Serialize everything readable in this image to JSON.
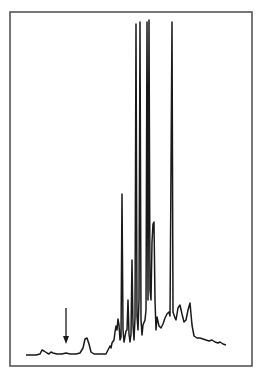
{
  "chart_data": {
    "type": "line",
    "title": "",
    "xlabel": "",
    "ylabel": "",
    "grid": false,
    "legend": null,
    "annotations": [
      {
        "type": "arrow",
        "direction": "down",
        "x_px": 66,
        "y_top_px": 308,
        "y_tip_px": 344
      }
    ],
    "frame_px": {
      "left": 10,
      "top": 12,
      "right": 252,
      "bottom": 366
    },
    "baseline_y_px": 355,
    "trace_px": [
      [
        26,
        355
      ],
      [
        36,
        355
      ],
      [
        40,
        354
      ],
      [
        42,
        350
      ],
      [
        44,
        351
      ],
      [
        47,
        353
      ],
      [
        49,
        354
      ],
      [
        51,
        352
      ],
      [
        53,
        353
      ],
      [
        57,
        354
      ],
      [
        62,
        354
      ],
      [
        66,
        353
      ],
      [
        70,
        354
      ],
      [
        76,
        354
      ],
      [
        80,
        353
      ],
      [
        83,
        348
      ],
      [
        85,
        339
      ],
      [
        87,
        338
      ],
      [
        89,
        344
      ],
      [
        91,
        352
      ],
      [
        94,
        354
      ],
      [
        106,
        354
      ],
      [
        108,
        350
      ],
      [
        110,
        346
      ],
      [
        111,
        348
      ],
      [
        112,
        343
      ],
      [
        114,
        340
      ],
      [
        115,
        332
      ],
      [
        116,
        326
      ],
      [
        117,
        330
      ],
      [
        118,
        319
      ],
      [
        119,
        325
      ],
      [
        120,
        340
      ],
      [
        121,
        337
      ],
      [
        122,
        194
      ],
      [
        123,
        330
      ],
      [
        124,
        342
      ],
      [
        126,
        331
      ],
      [
        127,
        330
      ],
      [
        128,
        300
      ],
      [
        129,
        334
      ],
      [
        130,
        342
      ],
      [
        131,
        334
      ],
      [
        132,
        260
      ],
      [
        133,
        326
      ],
      [
        134,
        340
      ],
      [
        135,
        318
      ],
      [
        136,
        24
      ],
      [
        137,
        316
      ],
      [
        138,
        330
      ],
      [
        139,
        300
      ],
      [
        140,
        22
      ],
      [
        141,
        320
      ],
      [
        142,
        335
      ],
      [
        143,
        325
      ],
      [
        145,
        320
      ],
      [
        146,
        310
      ],
      [
        147,
        22
      ],
      [
        148,
        300
      ],
      [
        149,
        20
      ],
      [
        150,
        290
      ],
      [
        151,
        300
      ],
      [
        152,
        242
      ],
      [
        153,
        224
      ],
      [
        154,
        222
      ],
      [
        155,
        300
      ],
      [
        156,
        330
      ],
      [
        157,
        317
      ],
      [
        159,
        326
      ],
      [
        161,
        328
      ],
      [
        163,
        324
      ],
      [
        165,
        318
      ],
      [
        167,
        314
      ],
      [
        169,
        312
      ],
      [
        170,
        316
      ],
      [
        172,
        22
      ],
      [
        173,
        312
      ],
      [
        175,
        318
      ],
      [
        176,
        320
      ],
      [
        178,
        308
      ],
      [
        180,
        305
      ],
      [
        182,
        314
      ],
      [
        184,
        322
      ],
      [
        186,
        320
      ],
      [
        188,
        310
      ],
      [
        190,
        303
      ],
      [
        192,
        325
      ],
      [
        194,
        336
      ],
      [
        197,
        338
      ],
      [
        200,
        338
      ],
      [
        203,
        339
      ],
      [
        206,
        340
      ],
      [
        209,
        341
      ],
      [
        212,
        340
      ],
      [
        215,
        342
      ],
      [
        218,
        343
      ],
      [
        220,
        342
      ],
      [
        223,
        344
      ],
      [
        226,
        345
      ]
    ],
    "major_peaks_px": [
      {
        "x": 122,
        "y": 194
      },
      {
        "x": 132,
        "y": 260
      },
      {
        "x": 136,
        "y": 24
      },
      {
        "x": 140,
        "y": 22
      },
      {
        "x": 147,
        "y": 22
      },
      {
        "x": 149,
        "y": 20
      },
      {
        "x": 154,
        "y": 222
      },
      {
        "x": 172,
        "y": 22
      },
      {
        "x": 190,
        "y": 303
      },
      {
        "x": 86,
        "y": 338
      }
    ],
    "colors": {
      "line": "#1a1a1a",
      "frame": "#555555",
      "background": "#ffffff"
    }
  }
}
